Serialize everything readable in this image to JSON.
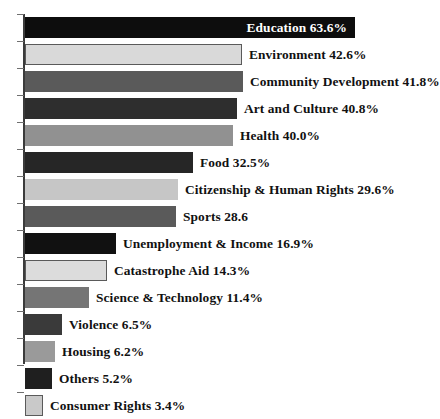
{
  "chart_data": {
    "type": "bar",
    "orientation": "horizontal",
    "title": "",
    "subtitle": "",
    "xlabel": "",
    "ylabel": "",
    "xlim": [
      0,
      70
    ],
    "grid": false,
    "legend": false,
    "axis_line_color": "#3b3b3b",
    "categories": [
      "Education",
      "Environment",
      "Community Development",
      "Art and Culture",
      "Health",
      "Food",
      "Citizenship & Human Rights",
      "Sports",
      "Unemployment & Income",
      "Catastrophe Aid",
      "Science & Technology",
      "Violence",
      "Housing",
      "Others",
      "Consumer Rights"
    ],
    "values": [
      63.6,
      42.6,
      41.8,
      40.8,
      40.0,
      32.5,
      29.6,
      28.6,
      16.9,
      14.3,
      11.4,
      6.5,
      6.2,
      5.2,
      3.4
    ],
    "bars": [
      {
        "category": "Education",
        "value": 63.6,
        "label": "Education 63.6%",
        "color": "#0d0d0d",
        "label_position": "inside",
        "label_color": "#ffffff",
        "bar_width_px": 330
      },
      {
        "category": "Environment",
        "value": 42.6,
        "label": "Environment 42.6%",
        "color": "#d9d9d9",
        "label_position": "outside",
        "label_color": "#111111",
        "bar_width_px": 217
      },
      {
        "category": "Community Development",
        "value": 41.8,
        "label": "Community Development 41.8%",
        "color": "#5a5a5a",
        "label_position": "outside",
        "label_color": "#111111",
        "bar_width_px": 218
      },
      {
        "category": "Art and Culture",
        "value": 40.8,
        "label": "Art and Culture 40.8%",
        "color": "#2e2e2e",
        "label_position": "outside",
        "label_color": "#111111",
        "bar_width_px": 212
      },
      {
        "category": "Health",
        "value": 40.0,
        "label": "Health 40.0%",
        "color": "#919191",
        "label_position": "outside",
        "label_color": "#111111",
        "bar_width_px": 208
      },
      {
        "category": "Food",
        "value": 32.5,
        "label": "Food 32.5%",
        "color": "#262626",
        "label_position": "outside",
        "label_color": "#111111",
        "bar_width_px": 168
      },
      {
        "category": "Citizenship & Human Rights",
        "value": 29.6,
        "label": "Citizenship & Human Rights 29.6%",
        "color": "#c6c6c6",
        "label_position": "outside",
        "label_color": "#111111",
        "bar_width_px": 153
      },
      {
        "category": "Sports",
        "value": 28.6,
        "label": "Sports 28.6",
        "color": "#5a5a5a",
        "label_position": "outside",
        "label_color": "#111111",
        "bar_width_px": 151
      },
      {
        "category": "Unemployment & Income",
        "value": 16.9,
        "label": "Unemployment & Income 16.9%",
        "color": "#111111",
        "label_position": "outside",
        "label_color": "#111111",
        "bar_width_px": 91
      },
      {
        "category": "Catastrophe Aid",
        "value": 14.3,
        "label": "Catastrophe Aid 14.3%",
        "color": "#dcdcdc",
        "label_position": "outside",
        "label_color": "#111111",
        "bar_width_px": 82
      },
      {
        "category": "Science & Technology",
        "value": 11.4,
        "label": "Science & Technology 11.4%",
        "color": "#757575",
        "label_position": "outside",
        "label_color": "#111111",
        "bar_width_px": 64
      },
      {
        "category": "Violence",
        "value": 6.5,
        "label": "Violence 6.5%",
        "color": "#3a3a3a",
        "label_position": "outside",
        "label_color": "#111111",
        "bar_width_px": 37
      },
      {
        "category": "Housing",
        "value": 6.2,
        "label": "Housing 6.2%",
        "color": "#9a9a9a",
        "label_position": "outside",
        "label_color": "#111111",
        "bar_width_px": 30
      },
      {
        "category": "Others",
        "value": 5.2,
        "label": "Others 5.2%",
        "color": "#1f1f1f",
        "label_position": "outside",
        "label_color": "#111111",
        "bar_width_px": 27
      },
      {
        "category": "Consumer Rights",
        "value": 3.4,
        "label": "Consumer Rights 3.4%",
        "color": "#c9c9c9",
        "label_position": "outside",
        "label_color": "#111111",
        "bar_width_px": 18
      }
    ]
  }
}
